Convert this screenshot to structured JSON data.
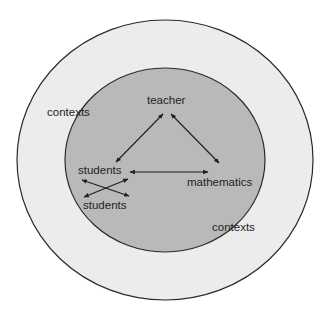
{
  "diagram": {
    "outer_region": {
      "label": "contexts",
      "fill": "#ececec",
      "stroke": "#2a2a2a"
    },
    "inner_region": {
      "label": "contexts",
      "fill": "#b9b9b9",
      "stroke": "#2a2a2a"
    },
    "nodes": {
      "teacher": "teacher",
      "students_top": "students",
      "students_bottom": "students",
      "mathematics": "mathematics"
    },
    "edges": [
      {
        "from": "teacher",
        "to": "students_top",
        "type": "bidirectional"
      },
      {
        "from": "teacher",
        "to": "mathematics",
        "type": "bidirectional"
      },
      {
        "from": "students_top",
        "to": "mathematics",
        "type": "bidirectional"
      },
      {
        "from": "students_top",
        "to": "students_bottom",
        "type": "bidirectional-cross"
      },
      {
        "from": "students_bottom",
        "to": "students_top",
        "type": "bidirectional-cross"
      }
    ]
  }
}
